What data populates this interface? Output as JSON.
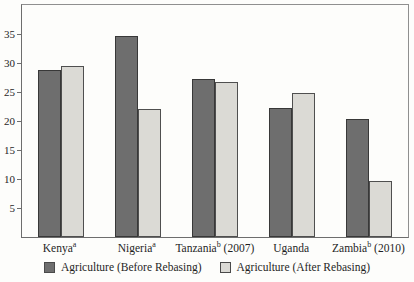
{
  "chart_data": {
    "type": "bar",
    "title": "",
    "xlabel": "",
    "ylabel": "",
    "ylim": [
      0,
      40
    ],
    "yticks": [
      5,
      10,
      15,
      20,
      25,
      30,
      35
    ],
    "grid": false,
    "legend_position": "bottom",
    "categories": [
      {
        "name": "Kenya",
        "sup": "a",
        "suffix": ""
      },
      {
        "name": "Nigeria",
        "sup": "a",
        "suffix": ""
      },
      {
        "name": "Tanzania",
        "sup": "b",
        "suffix": " (2007)"
      },
      {
        "name": "Uganda",
        "sup": "",
        "suffix": ""
      },
      {
        "name": "Zambia",
        "sup": "b",
        "suffix": " (2010)"
      }
    ],
    "series": [
      {
        "name": "Agriculture (Before Rebasing)",
        "values": [
          28.8,
          34.7,
          27.2,
          22.2,
          20.3
        ],
        "fill": "#6e6e6e",
        "border": "#383838"
      },
      {
        "name": "Agriculture (After Rebasing)",
        "values": [
          29.5,
          22.0,
          26.7,
          24.8,
          9.7
        ],
        "fill": "#dbdad5",
        "border": "#4f4f4f"
      }
    ]
  }
}
